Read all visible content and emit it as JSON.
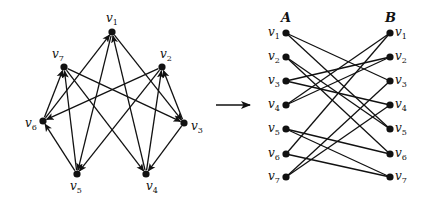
{
  "directed_graph": {
    "nodes": [
      {
        "id": "v1",
        "label": "v",
        "sub": "1",
        "x": 112,
        "y": 32,
        "lx": 106,
        "ly": 22
      },
      {
        "id": "v2",
        "label": "v",
        "sub": "2",
        "x": 162,
        "y": 67,
        "lx": 160,
        "ly": 58
      },
      {
        "id": "v3",
        "label": "v",
        "sub": "3",
        "x": 184,
        "y": 123,
        "lx": 191,
        "ly": 130
      },
      {
        "id": "v4",
        "label": "v",
        "sub": "4",
        "x": 146,
        "y": 174,
        "lx": 146,
        "ly": 190
      },
      {
        "id": "v5",
        "label": "v",
        "sub": "5",
        "x": 77,
        "y": 174,
        "lx": 70,
        "ly": 190
      },
      {
        "id": "v6",
        "label": "v",
        "sub": "6",
        "x": 43,
        "y": 121,
        "lx": 25,
        "ly": 127
      },
      {
        "id": "v7",
        "label": "v",
        "sub": "7",
        "x": 64,
        "y": 67,
        "lx": 52,
        "ly": 58
      }
    ],
    "edges": [
      [
        "v1",
        "v3"
      ],
      [
        "v1",
        "v5"
      ],
      [
        "v2",
        "v5"
      ],
      [
        "v2",
        "v6"
      ],
      [
        "v3",
        "v2"
      ],
      [
        "v3",
        "v4"
      ],
      [
        "v4",
        "v1"
      ],
      [
        "v4",
        "v2"
      ],
      [
        "v5",
        "v6"
      ],
      [
        "v5",
        "v7"
      ],
      [
        "v6",
        "v1"
      ],
      [
        "v6",
        "v7"
      ],
      [
        "v7",
        "v3"
      ],
      [
        "v7",
        "v4"
      ]
    ]
  },
  "transform_arrow": {
    "x1": 216,
    "y1": 105,
    "x2": 250,
    "y2": 105
  },
  "bipartite_graph": {
    "part_a_label": "A",
    "part_b_label": "B",
    "part_a_x": 286,
    "part_b_x": 390,
    "rows": [
      {
        "label": "v",
        "sub": "1",
        "y": 33
      },
      {
        "label": "v",
        "sub": "2",
        "y": 57
      },
      {
        "label": "v",
        "sub": "3",
        "y": 81
      },
      {
        "label": "v",
        "sub": "4",
        "y": 105
      },
      {
        "label": "v",
        "sub": "5",
        "y": 129
      },
      {
        "label": "v",
        "sub": "6",
        "y": 154
      },
      {
        "label": "v",
        "sub": "7",
        "y": 177
      }
    ],
    "edges": [
      [
        1,
        3
      ],
      [
        1,
        5
      ],
      [
        2,
        5
      ],
      [
        2,
        6
      ],
      [
        3,
        2
      ],
      [
        3,
        4
      ],
      [
        4,
        1
      ],
      [
        4,
        2
      ],
      [
        5,
        6
      ],
      [
        5,
        7
      ],
      [
        6,
        1
      ],
      [
        6,
        7
      ],
      [
        7,
        3
      ],
      [
        7,
        4
      ]
    ]
  },
  "colors": {
    "ink": "#111111",
    "background": "#ffffff"
  }
}
